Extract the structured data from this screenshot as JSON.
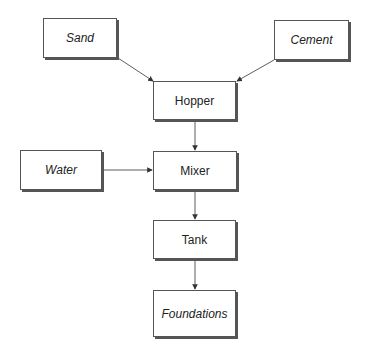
{
  "diagram": {
    "type": "flowchart",
    "nodes": [
      {
        "id": "sand",
        "label": "Sand",
        "italic": true
      },
      {
        "id": "cement",
        "label": "Cement",
        "italic": true
      },
      {
        "id": "hopper",
        "label": "Hopper",
        "italic": false
      },
      {
        "id": "water",
        "label": "Water",
        "italic": true
      },
      {
        "id": "mixer",
        "label": "Mixer",
        "italic": false
      },
      {
        "id": "tank",
        "label": "Tank",
        "italic": false
      },
      {
        "id": "foundations",
        "label": "Foundations",
        "italic": true
      }
    ],
    "edges": [
      {
        "from": "sand",
        "to": "hopper"
      },
      {
        "from": "cement",
        "to": "hopper"
      },
      {
        "from": "hopper",
        "to": "mixer"
      },
      {
        "from": "water",
        "to": "mixer"
      },
      {
        "from": "mixer",
        "to": "tank"
      },
      {
        "from": "tank",
        "to": "foundations"
      }
    ],
    "colors": {
      "line": "#333333",
      "border": "#555555",
      "background": "#ffffff"
    }
  }
}
